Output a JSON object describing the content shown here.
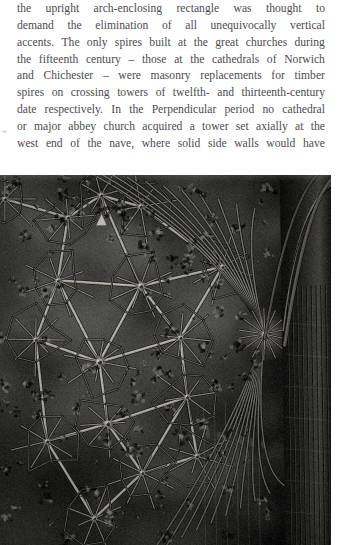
{
  "page": {
    "background_color": "#ffffff",
    "width": 344,
    "height": 545
  },
  "body_text": {
    "text_color": "#4c4b4e",
    "alignment": "justified",
    "paragraph": "the upright arch-enclosing rectangle was thought to demand the elimination of all unequivocally vertical accents. The only spires built at the great churches during the fifteenth century – those at the cathedrals of Norwich and Chichester – were masonry replacements for timber spires on crossing towers of twelfth- and thirteenth-century date respectively. In the Perpendicular period no cathedral or major abbey church acquired a tower set axially at the west end of the nave, where solid side walls would have",
    "lines": [
      "the upright arch-enclosing rectangle was thought to",
      "demand the elimination of all unequivocally vertical",
      "accents. The only spires built at the great churches during",
      "the fifteenth century – those at the cathedrals of Norwich",
      "and Chichester – were masonry replacements for timber",
      "spires on crossing towers of twelfth- and thirteenth-century",
      "date respectively. In the Perpendicular period no cathedral",
      "or major abbey church acquired a tower set axially at the",
      "west end of the nave, where solid side walls would have"
    ]
  },
  "plate": {
    "caption": "",
    "subject": "gothic-lierne-vault-ceiling-photograph",
    "tone": "monochrome",
    "dominant_color": "#141414",
    "highlight_color": "#9a9a96",
    "shadow_color": "#050505"
  },
  "margin_mark": {
    "color": "#d8d6d6"
  }
}
